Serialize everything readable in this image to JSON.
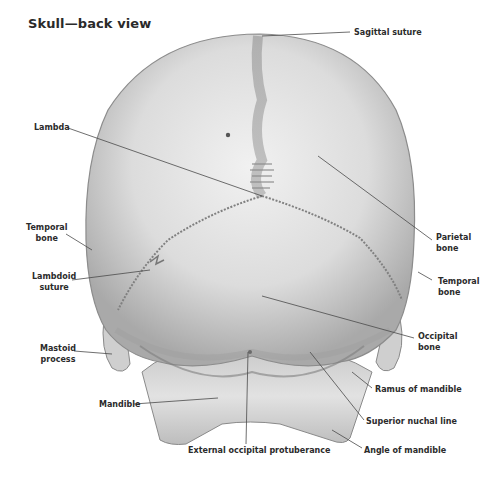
{
  "title": "Skull—back view",
  "labels": {
    "sagittal_suture": "Sagittal suture",
    "lambda": "Lambda",
    "parietal_bone_1": "Parietal",
    "parietal_bone_2": "bone",
    "temporal_bone_left_1": "Temporal",
    "temporal_bone_left_2": "bone",
    "temporal_bone_right_1": "Temporal",
    "temporal_bone_right_2": "bone",
    "lambdoid_suture_1": "Lambdoid",
    "lambdoid_suture_2": "suture",
    "occipital_bone_1": "Occipital",
    "occipital_bone_2": "bone",
    "mastoid_process_1": "Mastoid",
    "mastoid_process_2": "process",
    "ramus_of_mandible": "Ramus of mandible",
    "mandible": "Mandible",
    "superior_nuchal_line": "Superior nuchal line",
    "external_occipital_protuberance": "External occipital protuberance",
    "angle_of_mandible": "Angle of mandible"
  }
}
